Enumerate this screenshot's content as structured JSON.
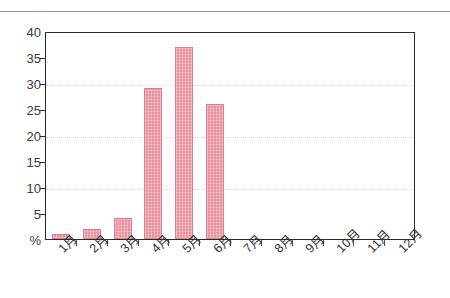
{
  "chart_data": {
    "type": "bar",
    "title": "",
    "subtitle": "",
    "xlabel": "",
    "ylabel": "%",
    "categories": [
      "1月",
      "2月",
      "3月",
      "4月",
      "5月",
      "6月",
      "7月",
      "8月",
      "9月",
      "10月",
      "11月",
      "12月"
    ],
    "values": [
      1,
      2,
      4,
      29,
      37,
      26,
      0,
      0,
      0,
      0,
      0,
      0
    ],
    "series": [
      {
        "name": "",
        "values": [
          1,
          2,
          4,
          29,
          37,
          26,
          0,
          0,
          0,
          0,
          0,
          0
        ]
      }
    ],
    "ylim": [
      0,
      40
    ],
    "yticks": [
      0,
      5,
      10,
      15,
      20,
      25,
      30,
      35,
      40
    ],
    "ytick_labels": [
      "%",
      "5",
      "10",
      "15",
      "20",
      "25",
      "30",
      "35",
      "40"
    ],
    "grid": true,
    "gridlines_at": [
      10,
      20,
      30
    ],
    "legend": false,
    "legend_position": "none",
    "annotations": [],
    "colors": {
      "bar_fill": "#e8929f",
      "bar_edge": "#dd7f90",
      "axis": "#2b2b2b",
      "gridline": "#d2dbe4",
      "text": "#2e2e2e",
      "top_rule": "#8f8f8f",
      "background": "#ffffff"
    }
  }
}
